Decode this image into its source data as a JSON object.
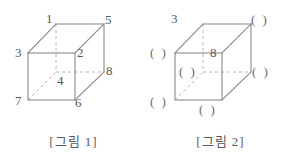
{
  "figures": [
    {
      "id": "figure-1",
      "caption": "[그림 1]",
      "labels": [
        {
          "name": "vertex-label-1",
          "text": "1",
          "x": 46,
          "y": 12
        },
        {
          "name": "vertex-label-5",
          "text": "5",
          "x": 105,
          "y": 13
        },
        {
          "name": "vertex-label-3",
          "text": "3",
          "x": 15,
          "y": 46
        },
        {
          "name": "vertex-label-2",
          "text": "2",
          "x": 77,
          "y": 46
        },
        {
          "name": "vertex-label-8",
          "text": "8",
          "x": 106,
          "y": 64
        },
        {
          "name": "vertex-label-4",
          "text": "4",
          "x": 57,
          "y": 74
        },
        {
          "name": "vertex-label-7",
          "text": "7",
          "x": 15,
          "y": 94
        },
        {
          "name": "vertex-label-6",
          "text": "6",
          "x": 75,
          "y": 96
        }
      ],
      "blanks": []
    },
    {
      "id": "figure-2",
      "caption": "[그림 2]",
      "labels": [
        {
          "name": "vertex-label-3",
          "text": "3",
          "x": 24,
          "y": 12
        },
        {
          "name": "vertex-label-8",
          "text": "8",
          "x": 63,
          "y": 46
        }
      ],
      "blanks": [
        {
          "name": "vertex-blank-top-right",
          "text": "( )",
          "x": 104,
          "y": 13
        },
        {
          "name": "vertex-blank-left-top",
          "text": "( )",
          "x": 3,
          "y": 46
        },
        {
          "name": "vertex-blank-hidden",
          "text": "( )",
          "x": 32,
          "y": 65
        },
        {
          "name": "vertex-blank-right-middle",
          "text": "( )",
          "x": 105,
          "y": 65
        },
        {
          "name": "vertex-blank-left-bottom",
          "text": "( )",
          "x": 3,
          "y": 95
        },
        {
          "name": "vertex-blank-bottom",
          "text": "( )",
          "x": 52,
          "y": 103
        }
      ]
    }
  ],
  "geometry": {
    "front_top_left": [
      28,
      53
    ],
    "front_top_right": [
      75,
      53
    ],
    "front_bottom_left": [
      28,
      100
    ],
    "front_bottom_right": [
      75,
      100
    ],
    "back_top_left": [
      56,
      24
    ],
    "back_top_right": [
      104,
      24
    ],
    "back_bottom_left": [
      56,
      72
    ],
    "back_bottom_right": [
      104,
      72
    ]
  },
  "colors": {
    "stroke": "#8a8a8d",
    "hidden_stroke": "#b4b4b6",
    "text": "#58585a",
    "background": "#ffffff"
  }
}
